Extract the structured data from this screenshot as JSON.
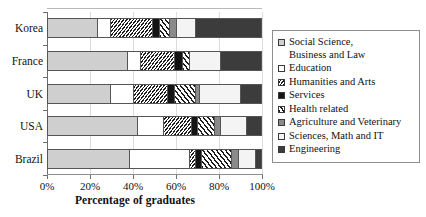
{
  "chart_data": {
    "type": "bar",
    "orientation": "horizontal",
    "stacked": true,
    "normalized": "100%",
    "title": "",
    "xlabel": "Percentage of graduates",
    "ylabel": "",
    "xlim": [
      0,
      100
    ],
    "xticks": [
      0,
      20,
      40,
      60,
      80,
      100
    ],
    "xticklabels": [
      "0%",
      "20%",
      "40%",
      "60%",
      "80%",
      "100%"
    ],
    "grid": "vertical",
    "legend_position": "right",
    "categories": [
      "Korea",
      "France",
      "UK",
      "USA",
      "Brazil"
    ],
    "series": [
      {
        "name": "Social Science, Business and Law",
        "pattern": "light-gray-solid",
        "values": [
          23,
          37,
          29,
          42,
          38
        ]
      },
      {
        "name": "Education",
        "pattern": "white-solid",
        "values": [
          6,
          6,
          11,
          12,
          28
        ]
      },
      {
        "name": "Humanities and Arts",
        "pattern": "dense-diagonal-hatch",
        "values": [
          20,
          16,
          16,
          13,
          3
        ]
      },
      {
        "name": "Services",
        "pattern": "black-solid",
        "values": [
          3,
          4,
          3,
          3,
          3
        ]
      },
      {
        "name": "Health related",
        "pattern": "wide-diagonal-stripe",
        "values": [
          5,
          3,
          10,
          8,
          14
        ]
      },
      {
        "name": "Agriculture and Veterinary",
        "pattern": "mid-gray-solid",
        "values": [
          3,
          0,
          2,
          3,
          3
        ]
      },
      {
        "name": "Sciences, Math and IT",
        "pattern": "white-dotted",
        "values": [
          9,
          15,
          19,
          12,
          8
        ]
      },
      {
        "name": "Engineering",
        "pattern": "dark-gray-solid",
        "values": [
          31,
          19,
          10,
          7,
          3
        ]
      }
    ]
  },
  "legend": {
    "items": [
      {
        "label": "Social Science,\nBusiness and Law",
        "swatch": "light-gray-solid"
      },
      {
        "label": "Education",
        "swatch": "white-solid"
      },
      {
        "label": "Humanities and Arts",
        "swatch": "dense-diagonal-hatch"
      },
      {
        "label": "Services",
        "swatch": "black-solid"
      },
      {
        "label": "Health related",
        "swatch": "wide-diagonal-stripe"
      },
      {
        "label": "Agriculture and Veterinary",
        "swatch": "mid-gray-solid"
      },
      {
        "label": "Sciences, Math and IT",
        "swatch": "white-dotted"
      },
      {
        "label": "Engineering",
        "swatch": "dark-gray-solid"
      }
    ]
  }
}
